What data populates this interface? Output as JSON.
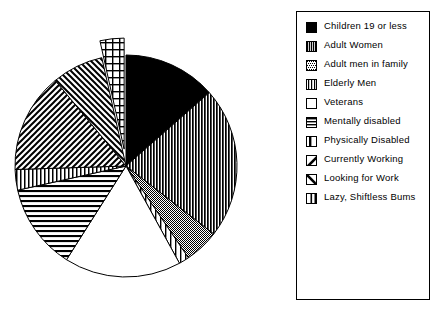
{
  "chart_data": {
    "type": "pie",
    "title": "",
    "subtitle": "",
    "xlabel": "",
    "ylabel": "",
    "legend_position": "right",
    "grid": false,
    "explode_note": "Lazy, Shiftless Bums slice is exploded away from the pie",
    "categories": [
      "Children 19 or less",
      "Adult Women",
      "Adult men in family",
      "Elderly Men",
      "Veterans",
      "Mentally disabled",
      "Physically Disabled",
      "Currently Working",
      "Looking for Work",
      "Lazy, Shiftless Bums"
    ],
    "values": [
      13.5,
      22.0,
      5.0,
      1.5,
      17.0,
      12.5,
      3.0,
      14.5,
      7.5,
      3.5
    ],
    "units": "percent",
    "slices": [
      {
        "label": "Children 19 or less",
        "value": 13.5,
        "pattern": "solid-black",
        "start_angle_deg": 0,
        "end_angle_deg": 48.6,
        "exploded": false
      },
      {
        "label": "Adult Women",
        "value": 22.0,
        "pattern": "dense-vertical-lines",
        "start_angle_deg": 48.6,
        "end_angle_deg": 127.8,
        "exploded": false
      },
      {
        "label": "Adult men in family",
        "value": 5.0,
        "pattern": "fine-dots",
        "start_angle_deg": 127.8,
        "end_angle_deg": 145.8,
        "exploded": false
      },
      {
        "label": "Elderly Men",
        "value": 1.5,
        "pattern": "sparse-vertical-lines",
        "start_angle_deg": 145.8,
        "end_angle_deg": 151.2,
        "exploded": false
      },
      {
        "label": "Veterans",
        "value": 17.0,
        "pattern": "white-empty",
        "start_angle_deg": 151.2,
        "end_angle_deg": 212.4,
        "exploded": false
      },
      {
        "label": "Mentally disabled",
        "value": 12.5,
        "pattern": "horizontal-lines",
        "start_angle_deg": 212.4,
        "end_angle_deg": 257.4,
        "exploded": false
      },
      {
        "label": "Physically Disabled",
        "value": 3.0,
        "pattern": "narrow-vertical-lines",
        "start_angle_deg": 257.4,
        "end_angle_deg": 268.2,
        "exploded": false
      },
      {
        "label": "Currently Working",
        "value": 14.5,
        "pattern": "backslash-diagonal",
        "start_angle_deg": 268.2,
        "end_angle_deg": 320.4,
        "exploded": false
      },
      {
        "label": "Looking for Work",
        "value": 7.5,
        "pattern": "forward-slash-diagonal",
        "start_angle_deg": 320.4,
        "end_angle_deg": 347.4,
        "exploded": false
      },
      {
        "label": "Lazy, Shiftless Bums",
        "value": 3.5,
        "pattern": "crosshatch-grid",
        "start_angle_deg": 347.4,
        "end_angle_deg": 360.0,
        "exploded": true
      }
    ]
  },
  "legend": {
    "items": [
      {
        "label": "Children 19 or less",
        "pattern": "solid-black"
      },
      {
        "label": "Adult Women",
        "pattern": "dense-vertical-lines"
      },
      {
        "label": "Adult men in family",
        "pattern": "fine-dots"
      },
      {
        "label": "Elderly Men",
        "pattern": "sparse-vertical-lines"
      },
      {
        "label": "Veterans",
        "pattern": "white-empty"
      },
      {
        "label": "Mentally disabled",
        "pattern": "horizontal-lines"
      },
      {
        "label": "Physically Disabled",
        "pattern": "narrow-vertical-lines"
      },
      {
        "label": "Currently Working",
        "pattern": "backslash-diagonal"
      },
      {
        "label": "Looking for Work",
        "pattern": "forward-slash-diagonal"
      },
      {
        "label": "Lazy, Shiftless Bums",
        "pattern": "crosshatch-grid"
      }
    ]
  },
  "colors": {
    "ink": "#000000",
    "paper": "#ffffff"
  }
}
